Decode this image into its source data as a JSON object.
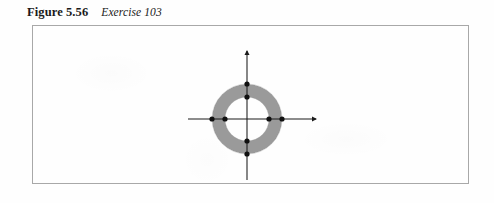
{
  "caption": {
    "figure_label": "Figure 5.56",
    "figure_title": "Exercise 103"
  },
  "figure": {
    "frame": {
      "x": 32,
      "y": 25,
      "width": 437,
      "height": 159,
      "border_color": "#a8a8a8",
      "background_color": "#fefefe"
    },
    "colors": {
      "annulus_fill": "#9a9a9a",
      "annulus_edge": "#8e8e8e",
      "axis": "#1a1a1a",
      "point": "#101010"
    }
  },
  "chart_data": {
    "type": "diagram",
    "xlabel": "",
    "ylabel": "",
    "grid": false,
    "legend": null,
    "center": {
      "x": 247,
      "y": 119
    },
    "shapes": [
      {
        "name": "annulus",
        "kind": "annulus",
        "center": {
          "x": 247,
          "y": 119
        },
        "outer_radius": 35,
        "inner_radius": 22,
        "fill": "#9a9a9a",
        "shaded": true
      }
    ],
    "axes": [
      {
        "name": "x-axis",
        "orientation": "horizontal",
        "from": {
          "x": 188,
          "y": 119
        },
        "to": {
          "x": 316,
          "y": 119
        },
        "arrow_at": "end"
      },
      {
        "name": "y-axis",
        "orientation": "vertical",
        "from": {
          "x": 247,
          "y": 180
        },
        "to": {
          "x": 247,
          "y": 51
        },
        "arrow_at": "end"
      }
    ],
    "points": [
      {
        "label": "outer-right",
        "x": 282,
        "y": 119,
        "radius": 2.6
      },
      {
        "label": "inner-right",
        "x": 269,
        "y": 119,
        "radius": 2.6
      },
      {
        "label": "inner-left",
        "x": 225,
        "y": 119,
        "radius": 2.6
      },
      {
        "label": "outer-left",
        "x": 212,
        "y": 119,
        "radius": 2.6
      },
      {
        "label": "outer-top",
        "x": 247,
        "y": 84,
        "radius": 2.6
      },
      {
        "label": "inner-top",
        "x": 247,
        "y": 97,
        "radius": 2.6
      },
      {
        "label": "inner-bottom",
        "x": 247,
        "y": 141,
        "radius": 2.6
      },
      {
        "label": "outer-bottom",
        "x": 247,
        "y": 154,
        "radius": 2.6
      }
    ],
    "annotations": []
  }
}
